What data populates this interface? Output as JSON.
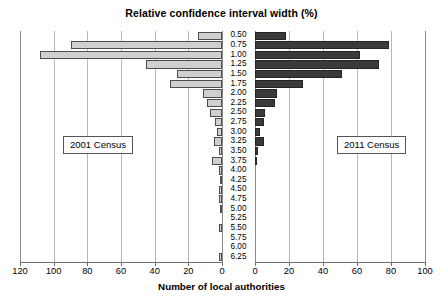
{
  "chart_data": {
    "type": "bar",
    "orientation": "horizontal",
    "layout": "bilateral-pyramid",
    "title": "Relative confidence interval width (%)",
    "xlabel": "Number of local authorities",
    "ylabel": "Relative confidence interval width (%)",
    "grid": true,
    "legend_position": "inside-panels",
    "categories": [
      "0.50",
      "0.75",
      "1.00",
      "1.25",
      "1.50",
      "1.75",
      "2.00",
      "2.25",
      "2.50",
      "2.75",
      "3.00",
      "3.25",
      "3.50",
      "3.75",
      "4.00",
      "4.25",
      "4.50",
      "4.75",
      "5.00",
      "5.25",
      "5.50",
      "5.75",
      "6.00",
      "6.25"
    ],
    "series": [
      {
        "name": "2001 Census",
        "side": "left",
        "color": "#d0d0d0",
        "xlim": [
          0,
          120
        ],
        "xticks": [
          120,
          100,
          80,
          60,
          40,
          20,
          0
        ],
        "values": [
          14,
          90,
          108,
          45,
          27,
          31,
          11,
          9,
          7,
          4,
          3,
          5,
          2,
          6,
          2,
          1,
          2,
          2,
          1,
          0,
          2,
          0,
          0,
          2
        ]
      },
      {
        "name": "2011 Census",
        "side": "right",
        "color": "#3a3a3a",
        "xlim": [
          0,
          100
        ],
        "xticks": [
          0,
          20,
          40,
          60,
          80,
          100
        ],
        "values": [
          18,
          79,
          62,
          73,
          51,
          28,
          13,
          12,
          6,
          5,
          3,
          5,
          2,
          1,
          0,
          0,
          0,
          0,
          0,
          0,
          0,
          0,
          0,
          0
        ]
      }
    ],
    "left_axis_ticks": [
      "120",
      "100",
      "80",
      "60",
      "40",
      "20",
      "0"
    ],
    "right_axis_ticks": [
      "0",
      "20",
      "40",
      "60",
      "80",
      "100"
    ],
    "legend_left_label": "2001 Census",
    "legend_right_label": "2011 Census"
  }
}
